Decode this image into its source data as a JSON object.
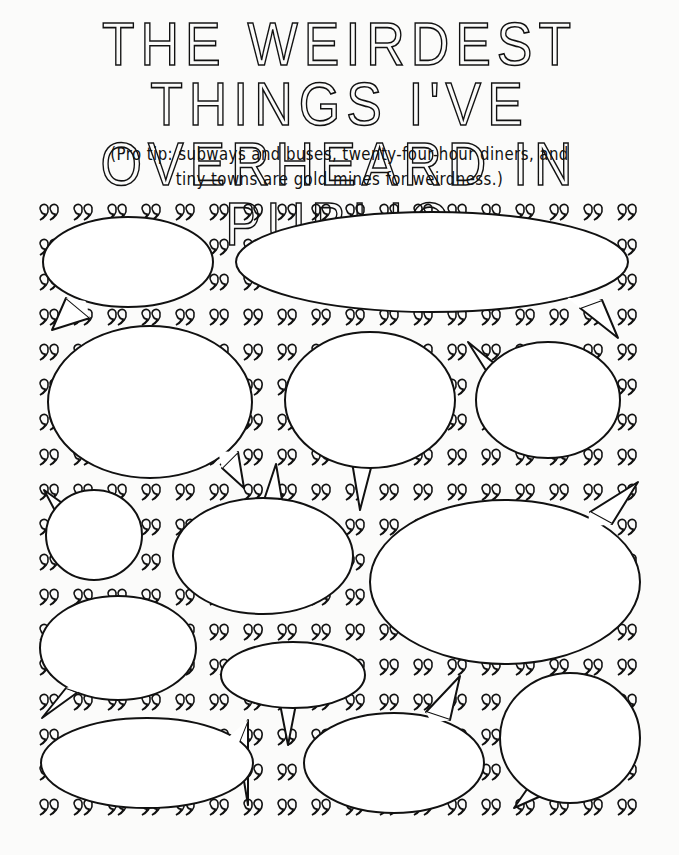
{
  "page": {
    "title_line1": "THE WEIRDEST THINGS I'VE",
    "title_line2": "OVERHEARD IN PUBLIC",
    "subtitle_line1": "(Pro tip: subways and buses, twenty-four-hour diners, and",
    "subtitle_line2": "tiny towns are gold mines for weirdness.)"
  },
  "pattern": {
    "glyph": "quote-marks",
    "origin_x": 48,
    "origin_y": 212,
    "step_x": 34,
    "step_y": 35,
    "cols": 18,
    "rows": 18
  },
  "bubbles": [
    {
      "id": 1,
      "cx": 128,
      "cy": 262,
      "rx": 85,
      "ry": 45,
      "tail": [
        [
          66,
          298
        ],
        [
          52,
          330
        ],
        [
          90,
          318
        ]
      ]
    },
    {
      "id": 2,
      "cx": 432,
      "cy": 262,
      "rx": 196,
      "ry": 50,
      "tail": [
        [
          580,
          308
        ],
        [
          618,
          338
        ],
        [
          602,
          300
        ]
      ]
    },
    {
      "id": 3,
      "cx": 150,
      "cy": 402,
      "rx": 102,
      "ry": 76,
      "tail": [
        [
          222,
          468
        ],
        [
          244,
          488
        ],
        [
          238,
          452
        ]
      ]
    },
    {
      "id": 4,
      "cx": 370,
      "cy": 400,
      "rx": 85,
      "ry": 68,
      "tail": [
        [
          352,
          462
        ],
        [
          360,
          510
        ],
        [
          372,
          464
        ]
      ]
    },
    {
      "id": 5,
      "cx": 548,
      "cy": 400,
      "rx": 72,
      "ry": 58,
      "tail": [
        [
          500,
          368
        ],
        [
          468,
          342
        ],
        [
          492,
          380
        ]
      ]
    },
    {
      "id": 6,
      "cx": 94,
      "cy": 535,
      "rx": 48,
      "ry": 45,
      "tail": [
        [
          72,
          510
        ],
        [
          44,
          490
        ],
        [
          60,
          520
        ]
      ]
    },
    {
      "id": 7,
      "cx": 263,
      "cy": 556,
      "rx": 90,
      "ry": 58,
      "tail": [
        [
          264,
          500
        ],
        [
          276,
          464
        ],
        [
          282,
          500
        ]
      ]
    },
    {
      "id": 8,
      "cx": 505,
      "cy": 582,
      "rx": 135,
      "ry": 82,
      "tail": [
        [
          590,
          512
        ],
        [
          638,
          482
        ],
        [
          612,
          524
        ]
      ]
    },
    {
      "id": 9,
      "cx": 118,
      "cy": 648,
      "rx": 78,
      "ry": 52,
      "tail": [
        [
          66,
          688
        ],
        [
          42,
          718
        ],
        [
          78,
          692
        ]
      ]
    },
    {
      "id": 10,
      "cx": 293,
      "cy": 675,
      "rx": 72,
      "ry": 33,
      "tail": [
        [
          280,
          704
        ],
        [
          288,
          745
        ],
        [
          296,
          704
        ]
      ]
    },
    {
      "id": 11,
      "cx": 147,
      "cy": 763,
      "rx": 106,
      "ry": 45,
      "tail": [
        [
          238,
          745
        ],
        [
          248,
          805
        ],
        [
          248,
          720
        ]
      ]
    },
    {
      "id": 12,
      "cx": 394,
      "cy": 763,
      "rx": 90,
      "ry": 50,
      "tail": [
        [
          426,
          712
        ],
        [
          460,
          676
        ],
        [
          450,
          720
        ]
      ]
    },
    {
      "id": 13,
      "cx": 570,
      "cy": 738,
      "rx": 70,
      "ry": 65,
      "tail": [
        [
          530,
          785
        ],
        [
          514,
          808
        ],
        [
          550,
          792
        ]
      ]
    }
  ]
}
